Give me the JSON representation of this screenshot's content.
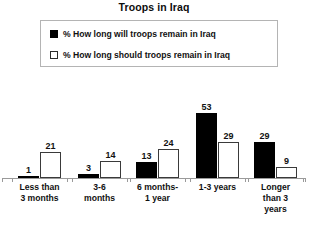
{
  "chart_data": {
    "type": "bar",
    "title": "Troops in Iraq",
    "xlabel": "",
    "ylabel": "",
    "ylim": [
      0,
      60
    ],
    "grid": false,
    "legend_position": "top-center",
    "categories": [
      "Less than\n3 months",
      "3-6\nmonths",
      "6 months-\n1 year",
      "1-3 years",
      "Longer\nthan 3\nyears"
    ],
    "series": [
      {
        "name": "% How long will troops remain in Iraq",
        "marker": "filled-square",
        "color": "#000000",
        "values": [
          1,
          3,
          13,
          53,
          29
        ]
      },
      {
        "name": "% How long should troops remain in Iraq",
        "marker": "hollow-square",
        "color": "#ffffff",
        "values": [
          21,
          14,
          24,
          29,
          9
        ]
      }
    ]
  },
  "legend": {
    "items": [
      {
        "label": "% How long will troops remain in Iraq",
        "marker": "filled-square"
      },
      {
        "label": "% How long should troops remain in Iraq",
        "marker": "hollow-square"
      }
    ]
  },
  "colors": {
    "series_dark": "#000000",
    "series_light": "#ffffff",
    "outline": "#3a3a3a",
    "axis": "#9a9a9a",
    "legend_border": "#b4b4b4",
    "text": "#111111",
    "background": "#ffffff"
  }
}
